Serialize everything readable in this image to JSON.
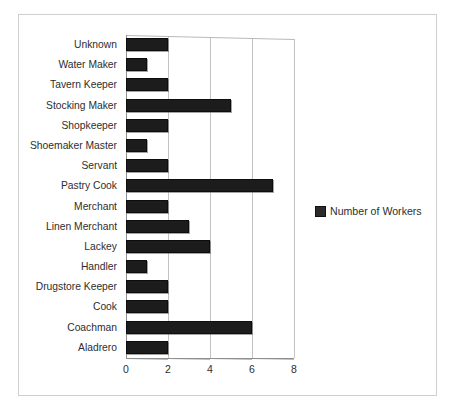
{
  "chart_data": {
    "type": "bar",
    "orientation": "horizontal",
    "title": "",
    "xlabel": "",
    "ylabel": "",
    "xlim": [
      0,
      8
    ],
    "xticks": [
      0,
      2,
      4,
      6,
      8
    ],
    "grid": true,
    "legend_position": "right",
    "series": [
      {
        "name": "Number of Workers",
        "color": "#1c1c1c",
        "values": [
          2,
          1,
          2,
          5,
          2,
          1,
          2,
          7,
          2,
          3,
          4,
          1,
          2,
          2,
          6,
          2
        ]
      }
    ],
    "categories": [
      "Unknown",
      "Water Maker",
      "Tavern Keeper",
      "Stocking Maker",
      "Shopkeeper",
      "Shoemaker Master",
      "Servant",
      "Pastry Cook",
      "Merchant",
      "Linen Merchant",
      "Lackey",
      "Handler",
      "Drugstore Keeper",
      "Cook",
      "Coachman",
      "Aladrero"
    ]
  },
  "legend": {
    "label": "Number of Workers",
    "swatch_color": "#2b2b2b"
  },
  "colors": {
    "bar": "#1c1c1c",
    "grid": "#c3c3c3",
    "axis": "#8f8f8f",
    "frame": "#cfcfcf",
    "background": "#ffffff",
    "text": "#2e2e2e"
  }
}
